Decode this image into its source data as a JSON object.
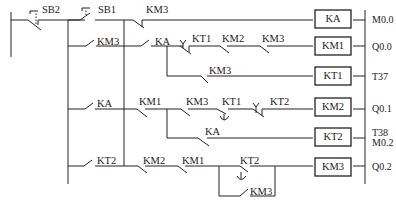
{
  "diagram": {
    "type": "PLC ladder / relay control circuit",
    "rungs": [
      {
        "contacts": [
          "SB2 (NC pushbutton)",
          "SB1 (NO pushbutton)",
          "KM3 (NC)"
        ],
        "coil": "KA",
        "address": "M0.0"
      },
      {
        "contacts": [
          "KM3 (NO, parallel to SB1)",
          "KA (NO)",
          "KT1 (NC timed)",
          "KM2 (NC)",
          "KM3 (NC)"
        ],
        "coil": "KM1",
        "address": "Q0.0"
      },
      {
        "contacts": [
          "KM3 (NC, branch after KA)"
        ],
        "coil": "KT1",
        "address": "T37"
      },
      {
        "contacts": [
          "KA (NO)",
          "KM1 (NC)",
          "KM3 (NC)",
          "KT1 (NO timed)",
          "KT2 (NC timed)"
        ],
        "coil": "KM2",
        "address": "Q0.1"
      },
      {
        "contacts": [
          "KA (NC, branch after KM1)"
        ],
        "coil": "KT2",
        "address": "T38 M0.2"
      },
      {
        "contacts": [
          "KT2 (NO)",
          "KM2 (NC)",
          "KM1 (NC)",
          "KT2 (NO timed) || KM3 (NO)"
        ],
        "coil": "KM3",
        "address": "Q0.2"
      }
    ],
    "labels": {
      "sb2": "SB2",
      "sb1": "SB1",
      "km3_r1": "KM3",
      "km3_r2a": "KM3",
      "ka_r2": "KA",
      "kt1_r2": "KT1",
      "km2_r2": "KM2",
      "km3_r2b": "KM3",
      "km3_r3": "KM3",
      "ka_r4": "KA",
      "km1_r4": "KM1",
      "km3_r4": "KM3",
      "kt1_r4": "KT1",
      "kt2_r4": "KT2",
      "ka_r5": "KA",
      "kt2_r6": "KT2",
      "km2_r6": "KM2",
      "km1_r6": "KM1",
      "kt2_r6b": "KT2",
      "km3_r6": "KM3"
    },
    "coils": [
      "KA",
      "KM1",
      "KT1",
      "KM2",
      "KT2",
      "KM3"
    ],
    "addresses": [
      "M0.0",
      "Q0.0",
      "T37",
      "Q0.1",
      "T38",
      "M0.2",
      "Q0.2"
    ]
  }
}
